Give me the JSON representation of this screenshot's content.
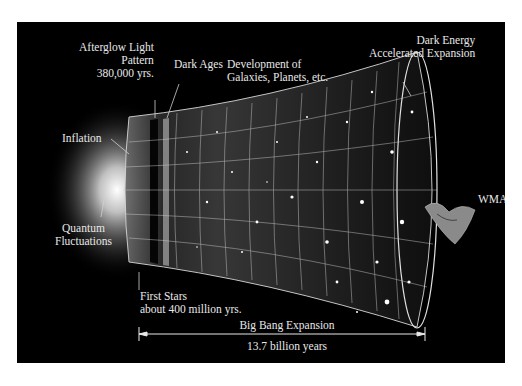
{
  "diagram": {
    "labels": {
      "afterglow": [
        "Afterglow Light",
        "Pattern",
        "380,000 yrs."
      ],
      "dark_ages": "Dark Ages",
      "development": [
        "Development of",
        "Galaxies, Planets, etc."
      ],
      "dark_energy": [
        "Dark Energy",
        "Accelerated Expansion"
      ],
      "inflation": "Inflation",
      "quantum": [
        "Quantum",
        "Fluctuations"
      ],
      "wmap": "WMAP",
      "first_stars": [
        "First Stars",
        "about 400 million yrs."
      ],
      "big_bang": "Big Bang Expansion",
      "duration": "13.7 billion years"
    },
    "colors": {
      "background": "#000000",
      "frame": "#ffffff",
      "text": "#e8e8e8",
      "grid": "#d0d0d0"
    }
  }
}
